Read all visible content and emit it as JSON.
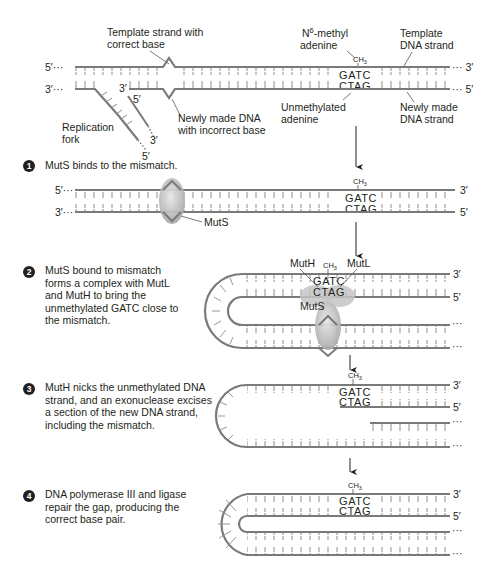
{
  "colors": {
    "strand": "#7a7a7a",
    "tick": "#8c8c8c",
    "protein": "#bdbdbd",
    "text": "#231f20",
    "arrow": "#231f20"
  },
  "top": {
    "label_template_correct": [
      "Template strand with",
      "correct base"
    ],
    "label_new_incorrect": [
      "Newly made DNA",
      "with incorrect base"
    ],
    "label_n6_methyl": [
      "N",
      "6",
      "-methyl",
      "adenine"
    ],
    "label_template_dna": [
      "Template",
      "DNA strand"
    ],
    "label_unmethylated": [
      "Unmethylated",
      "adenine"
    ],
    "label_new_dna": [
      "Newly made",
      "DNA strand"
    ],
    "label_replication_fork": [
      "Replication",
      "fork"
    ],
    "end_5_top": "5′···",
    "end_3_top_right": "··· 3′",
    "end_3_bottom": "3′···",
    "end_5_bottom_right": "··· 5′",
    "fork_3": "3′",
    "fork_5": "5′",
    "fork_tail_3": "3′",
    "fork_tail_5": "5′",
    "ch3": "CH3",
    "seq_top": "GATC",
    "seq_bottom": "CTAG"
  },
  "steps": [
    {
      "number": "1",
      "text": "MutS binds to the mismatch.",
      "labels": {
        "muts": "MutS",
        "end_5": "5′···",
        "end_3": "3′···",
        "right_3": "3′",
        "right_5": "5′"
      }
    },
    {
      "number": "2",
      "text": "MutS bound to mismatch forms a complex with MutL and MutH to bring the unmethylated GATC close to the mismatch.",
      "labels": {
        "muth": "MutH",
        "mutl": "MutL",
        "muts": "MutS",
        "right_3": "3′",
        "right_5": "5′",
        "dots": "···"
      }
    },
    {
      "number": "3",
      "text": "MutH nicks the unmethylated DNA strand, and an exonuclease excises a section of the new DNA strand, including the mismatch.",
      "labels": {
        "right_3": "3′",
        "right_5": "5′",
        "dots": "···"
      }
    },
    {
      "number": "4",
      "text": "DNA polymerase III and ligase repair the gap, producing the correct base pair.",
      "labels": {
        "right_3": "3′",
        "right_5": "5′",
        "dots": "···"
      }
    }
  ]
}
